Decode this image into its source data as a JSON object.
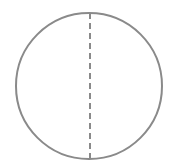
{
  "diagram": {
    "shape": "circle",
    "circle": {
      "cx": 89,
      "cy": 86,
      "r": 73,
      "stroke": "#8a8a8a",
      "stroke_width": 2
    },
    "diameter_line": {
      "x": 90,
      "y1": 13,
      "y2": 163,
      "style": "dashed",
      "stroke": "#8a8a8a"
    },
    "background": "#ffffff"
  }
}
